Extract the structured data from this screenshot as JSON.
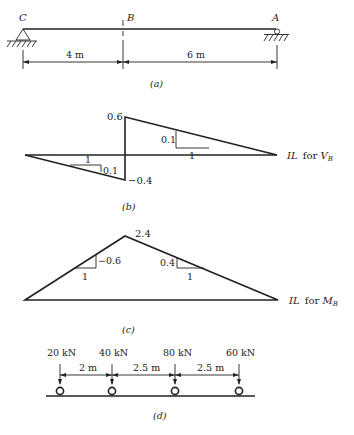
{
  "figure": {
    "panel_a": {
      "caption": "(a)",
      "points": [
        {
          "label": "C",
          "support": "pin"
        },
        {
          "label": "B",
          "support": "section-cut"
        },
        {
          "label": "A",
          "support": "roller"
        }
      ],
      "dimensions": [
        {
          "label": "4 m",
          "from": "C",
          "to": "B"
        },
        {
          "label": "6 m",
          "from": "B",
          "to": "A"
        }
      ]
    },
    "panel_b": {
      "caption": "(b)",
      "title_prefix": "IL for ",
      "title_var": "V",
      "title_sub": "B",
      "max_value": "0.6",
      "min_value": "−0.4",
      "left_slope": {
        "run": "1",
        "rise": "0.1"
      },
      "right_slope": {
        "run": "1",
        "rise": "0.1"
      }
    },
    "panel_c": {
      "caption": "(c)",
      "title_prefix": "IL for ",
      "title_var": "M",
      "title_sub": "B",
      "peak_value": "2.4",
      "left_slope": {
        "run": "1",
        "rise": "−0.6"
      },
      "right_slope": {
        "run": "1",
        "rise": "0.4"
      }
    },
    "panel_d": {
      "caption": "(d)",
      "loads": [
        {
          "label": "20 kN"
        },
        {
          "label": "40 kN"
        },
        {
          "label": "80 kN"
        },
        {
          "label": "60 kN"
        }
      ],
      "spacings": [
        {
          "label": "2 m"
        },
        {
          "label": "2.5 m"
        },
        {
          "label": "2.5 m"
        }
      ]
    }
  }
}
